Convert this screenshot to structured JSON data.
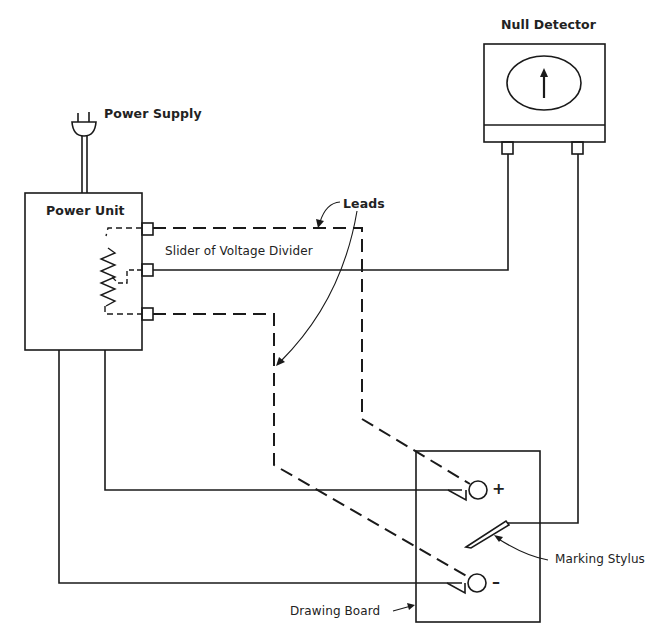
{
  "diagram": {
    "type": "circuit-schematic",
    "labels": {
      "null_detector": "Null Detector",
      "power_supply": "Power Supply",
      "power_unit": "Power Unit",
      "leads": "Leads",
      "slider": "Slider of Voltage Divider",
      "marking_stylus": "Marking Stylus",
      "drawing_board": "Drawing Board",
      "plus": "+",
      "minus": "–"
    },
    "components": [
      {
        "id": "null-detector",
        "kind": "meter",
        "indicator": "up-arrow"
      },
      {
        "id": "power-plug",
        "kind": "plug"
      },
      {
        "id": "power-unit",
        "kind": "box",
        "contains": "voltage-divider-resistor"
      },
      {
        "id": "drawing-board",
        "kind": "box",
        "terminals": [
          "+",
          "-"
        ]
      },
      {
        "id": "marking-stylus",
        "kind": "probe"
      }
    ],
    "connections": [
      {
        "from": "power-unit.top-terminal",
        "to": "drawing-board.plus",
        "style": "dashed",
        "label": "Leads"
      },
      {
        "from": "power-unit.bottom-terminal",
        "to": "drawing-board.minus",
        "style": "dashed",
        "label": "Leads"
      },
      {
        "from": "power-unit.slider-terminal",
        "to": "null-detector.left-terminal",
        "style": "solid"
      },
      {
        "from": "null-detector.right-terminal",
        "to": "marking-stylus",
        "style": "solid"
      },
      {
        "from": "power-unit.bottom",
        "to": "drawing-board.plus",
        "style": "solid"
      },
      {
        "from": "power-unit.bottom",
        "to": "drawing-board.minus",
        "style": "solid"
      }
    ],
    "colors": {
      "ink": "#1a1a1a",
      "paper": "#ffffff"
    }
  }
}
